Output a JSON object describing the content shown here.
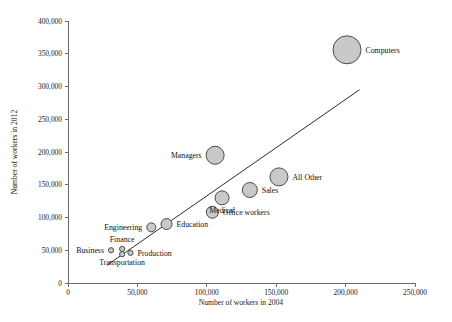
{
  "chart_data": {
    "type": "scatter",
    "title": "",
    "subtitle": "",
    "xlabel": "Number of workers in 2004",
    "ylabel": "Number of workers in 2012",
    "xlim": [
      0,
      250000
    ],
    "ylim": [
      0,
      400000
    ],
    "grid": false,
    "legend": "none",
    "bubble_size_encoding": "marker area scales with occupation size",
    "xticks": [
      0,
      50000,
      100000,
      150000,
      200000,
      250000
    ],
    "xticklabels": [
      "0",
      "50,000",
      "100,000",
      "150,000",
      "200,000",
      "250,000"
    ],
    "yticks": [
      0,
      50000,
      100000,
      150000,
      200000,
      250000,
      300000,
      350000,
      400000
    ],
    "yticklabels": [
      "0",
      "50,000",
      "100,000",
      "150,000",
      "200,000",
      "250,000",
      "300,000",
      "350,000",
      "400,000"
    ],
    "trendline": {
      "type": "linear",
      "x_start": 28000,
      "y_start": 27000,
      "x_end": 210000,
      "y_end": 295000
    },
    "points": [
      {
        "name": "Computers",
        "x": 201000,
        "y": 356000,
        "r": 14,
        "label": "Computers",
        "label_pos": "right"
      },
      {
        "name": "Managers",
        "x": 106000,
        "y": 195000,
        "r": 9,
        "label": "Managers",
        "label_pos": "left"
      },
      {
        "name": "All Other",
        "x": 152000,
        "y": 162000,
        "r": 9,
        "label": "All Other",
        "label_pos": "right"
      },
      {
        "name": "Sales",
        "x": 131000,
        "y": 142000,
        "r": 7.5,
        "label": "Sales",
        "label_pos": "right"
      },
      {
        "name": "Medical",
        "x": 111000,
        "y": 130000,
        "r": 7,
        "label": "Medical",
        "label_pos": "below"
      },
      {
        "name": "Office workers",
        "x": 104000,
        "y": 108000,
        "r": 6,
        "label": "Office workers",
        "label_pos": "right"
      },
      {
        "name": "Education",
        "x": 71000,
        "y": 90000,
        "r": 5.5,
        "label": "Education",
        "label_pos": "right"
      },
      {
        "name": "Engineering",
        "x": 60000,
        "y": 85000,
        "r": 4.5,
        "label": "Engineering",
        "label_pos": "left"
      },
      {
        "name": "Business",
        "x": 31000,
        "y": 50000,
        "r": 2.6,
        "label": "Business",
        "label_pos": "left"
      },
      {
        "name": "Finance",
        "x": 39000,
        "y": 52000,
        "r": 2.6,
        "label": "Finance",
        "label_pos": "above"
      },
      {
        "name": "Transportation",
        "x": 39000,
        "y": 44000,
        "r": 2.6,
        "label": "Transportation",
        "label_pos": "below"
      },
      {
        "name": "Production",
        "x": 45000,
        "y": 46000,
        "r": 2.6,
        "label": "Production",
        "label_pos": "right"
      }
    ]
  },
  "style": {
    "bubble_fill": "#c9c9c9",
    "bubble_stroke": "#4a4a4a",
    "axis_color": "#6b6b6b",
    "trend_color": "#2b2b2b",
    "text_color": "#101010",
    "background": "#ffffff"
  }
}
